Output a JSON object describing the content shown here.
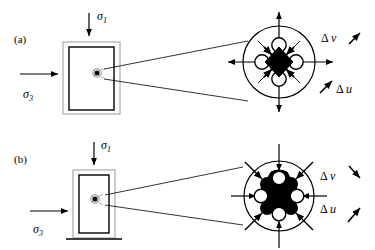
{
  "figure": {
    "type": "mechanics-diagram",
    "background_color": "#ffffff",
    "line_color": "#000000",
    "fill_dark": "#000000",
    "fill_light": "#ffffff",
    "panels": [
      {
        "id": "a",
        "label": "(a)",
        "state": "dilation",
        "specimen": {
          "name": "triaxial-specimen",
          "shape": "rectangle-with-membrane",
          "width_rel": "wide",
          "height_rel": "tall",
          "marker": "magnified-point"
        },
        "stresses": [
          {
            "name": "sigma-1",
            "symbol": "σ",
            "subscript": "1",
            "direction": "down",
            "position": "top"
          },
          {
            "name": "sigma-3",
            "symbol": "σ",
            "subscript": "3",
            "direction": "right",
            "position": "left"
          }
        ],
        "inset": {
          "name": "microstructure-inset",
          "outline": "circle",
          "core": {
            "shape": "diamond",
            "fill": "black",
            "size_rel": "small"
          },
          "voids": {
            "count": 4,
            "shape": "circle",
            "fill": "white",
            "positions": [
              "north",
              "east",
              "south",
              "west"
            ]
          },
          "internal_arrows": {
            "count": 4,
            "direction": "inward",
            "orientation": "diagonal"
          },
          "external_arrows": {
            "count": 4,
            "direction": "outward",
            "orientation": "cardinal"
          }
        },
        "displacements": [
          {
            "name": "delta-v",
            "symbol": "Δ",
            "variable": "v",
            "arrow": "up-right"
          },
          {
            "name": "delta-u",
            "symbol": "Δ",
            "variable": "u",
            "arrow": "up-right-lower"
          }
        ]
      },
      {
        "id": "b",
        "label": "(b)",
        "state": "contraction",
        "specimen": {
          "name": "triaxial-specimen",
          "shape": "rectangle-with-membrane-and-base",
          "width_rel": "narrow",
          "height_rel": "tall",
          "marker": "magnified-point"
        },
        "stresses": [
          {
            "name": "sigma-1",
            "symbol": "σ",
            "subscript": "1",
            "direction": "down",
            "position": "top"
          },
          {
            "name": "sigma-3",
            "symbol": "σ",
            "subscript": "3",
            "direction": "right",
            "position": "left"
          }
        ],
        "inset": {
          "name": "microstructure-inset",
          "outline": "circle",
          "core": {
            "shape": "rounded-cross-blob",
            "fill": "black",
            "size_rel": "large"
          },
          "voids": {
            "count": 4,
            "shape": "circle",
            "fill": "white",
            "positions": [
              "north",
              "east",
              "south",
              "west"
            ]
          },
          "internal_arrows": {
            "count": 0,
            "direction": "none",
            "orientation": "none"
          },
          "external_arrows": {
            "count": 8,
            "direction": "inward",
            "orientation": "cardinal-and-diagonal"
          }
        },
        "displacements": [
          {
            "name": "delta-v",
            "symbol": "Δ",
            "variable": "v",
            "arrow": "down-right"
          },
          {
            "name": "delta-u",
            "symbol": "Δ",
            "variable": "u",
            "arrow": "up-right"
          }
        ]
      }
    ],
    "symbols": {
      "sigma_char": "σ",
      "delta_char": "Δ",
      "sigma1_sub": "1",
      "sigma3_sub": "3",
      "v_char": "v",
      "u_char": "u"
    }
  }
}
